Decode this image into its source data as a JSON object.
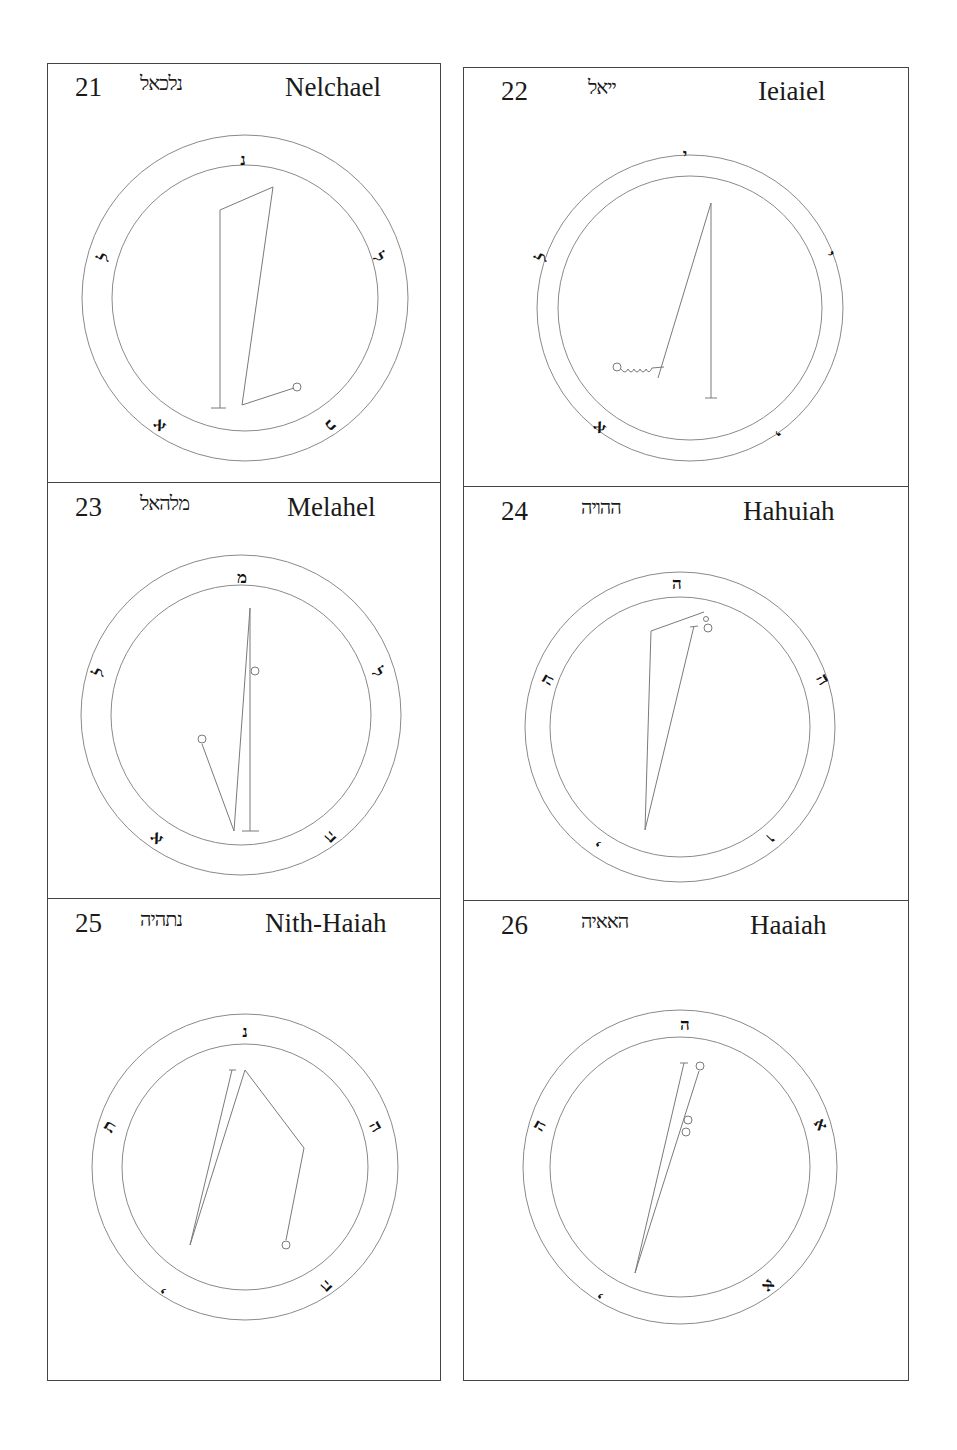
{
  "page": {
    "background": "#ffffff",
    "border_color": "#444444",
    "line_color": "#7a7a7a"
  },
  "panels": [
    {
      "number": "21",
      "hebrew": "נלכאל",
      "name": "Nelchael",
      "header": {
        "num_x": 75,
        "heb_x": 140,
        "name_x": 285,
        "top": 63
      },
      "circle": {
        "cx": 245,
        "cy": 298,
        "r_outer": 163,
        "r_inner": 133
      },
      "ring_letters": [
        {
          "char": "נ",
          "x": 243,
          "y": 160,
          "rot": 0
        },
        {
          "char": "ל",
          "x": 378,
          "y": 258,
          "rot": 60
        },
        {
          "char": "כ",
          "x": 330,
          "y": 425,
          "rot": 135
        },
        {
          "char": "א",
          "x": 160,
          "y": 425,
          "rot": -135
        },
        {
          "char": "ל",
          "x": 105,
          "y": 258,
          "rot": -60
        }
      ],
      "lines": [
        [
          [
            220,
            408
          ],
          [
            220,
            210
          ],
          [
            273,
            187
          ],
          [
            242,
            405
          ],
          [
            294,
            388
          ]
        ],
        [
          [
            211,
            408
          ],
          [
            226,
            408
          ]
        ]
      ],
      "dots": [
        {
          "x": 297,
          "y": 387,
          "r": 4
        }
      ]
    },
    {
      "number": "22",
      "hebrew": "ייאל",
      "name": "Ieiaiel",
      "header": {
        "num_x": 38,
        "heb_x": 130,
        "name_x": 295,
        "top": 67
      },
      "circle": {
        "cx": 690,
        "cy": 308,
        "r_outer": 153,
        "r_inner": 132
      },
      "ring_letters": [
        {
          "char": "י",
          "x": 685,
          "y": 155,
          "rot": 0
        },
        {
          "char": "י",
          "x": 829,
          "y": 255,
          "rot": 60
        },
        {
          "char": "י",
          "x": 776,
          "y": 432,
          "rot": 135
        },
        {
          "char": "א",
          "x": 600,
          "y": 427,
          "rot": -135
        },
        {
          "char": "ל",
          "x": 543,
          "y": 258,
          "rot": -60
        }
      ],
      "lines": [
        [
          [
            711,
            398
          ],
          [
            711,
            203
          ]
        ],
        [
          [
            705,
            398
          ],
          [
            717,
            398
          ]
        ],
        [
          [
            711,
            203
          ],
          [
            658,
            378
          ]
        ]
      ],
      "squiggle": {
        "x": 617,
        "y": 367
      },
      "dots": [
        {
          "x": 617,
          "y": 367,
          "r": 4
        }
      ]
    },
    {
      "number": "23",
      "hebrew": "מלהאל",
      "name": "Melahel",
      "header": {
        "num_x": 75,
        "heb_x": 140,
        "name_x": 288,
        "top": 482
      },
      "circle": {
        "cx": 241,
        "cy": 715,
        "r_outer": 160,
        "r_inner": 130
      },
      "ring_letters": [
        {
          "char": "מ",
          "x": 242,
          "y": 578,
          "rot": 0
        },
        {
          "char": "ל",
          "x": 377,
          "y": 673,
          "rot": 60
        },
        {
          "char": "ה",
          "x": 330,
          "y": 837,
          "rot": 135
        },
        {
          "char": "א",
          "x": 157,
          "y": 838,
          "rot": -135
        },
        {
          "char": "ל",
          "x": 100,
          "y": 673,
          "rot": -60
        }
      ],
      "lines": [
        [
          [
            250,
            831
          ],
          [
            250,
            608
          ],
          [
            234,
            831
          ],
          [
            202,
            744
          ]
        ],
        [
          [
            242,
            831
          ],
          [
            259,
            831
          ]
        ]
      ],
      "dots": [
        {
          "x": 255,
          "y": 671,
          "r": 4
        },
        {
          "x": 202,
          "y": 739,
          "r": 4
        }
      ]
    },
    {
      "number": "24",
      "hebrew": "ההויה",
      "name": "Hahuiah",
      "header": {
        "num_x": 38,
        "heb_x": 118,
        "name_x": 280,
        "top": 486
      },
      "circle": {
        "cx": 680,
        "cy": 727,
        "r_outer": 155,
        "r_inner": 130
      },
      "ring_letters": [
        {
          "char": "ה",
          "x": 677,
          "y": 584,
          "rot": 0
        },
        {
          "char": "ה",
          "x": 822,
          "y": 680,
          "rot": 60
        },
        {
          "char": "ו",
          "x": 770,
          "y": 838,
          "rot": 135
        },
        {
          "char": "י",
          "x": 600,
          "y": 842,
          "rot": -135
        },
        {
          "char": "ה",
          "x": 548,
          "y": 680,
          "rot": -60
        }
      ],
      "lines": [
        [
          [
            645,
            830
          ],
          [
            651,
            631
          ],
          [
            704,
            612
          ]
        ],
        [
          [
            645,
            830
          ],
          [
            694,
            626
          ]
        ],
        [
          [
            690,
            627
          ],
          [
            698,
            626
          ]
        ]
      ],
      "dots": [
        {
          "x": 708,
          "y": 628,
          "r": 4
        },
        {
          "x": 706,
          "y": 619,
          "r": 2.5
        }
      ]
    },
    {
      "number": "25",
      "hebrew": "נתהיה",
      "name": "Nith-Haiah",
      "header": {
        "num_x": 38,
        "heb_x": 98,
        "name_x": 218,
        "top": 898
      },
      "circle": {
        "cx": 245,
        "cy": 1167,
        "r_outer": 153,
        "r_inner": 123
      },
      "ring_letters": [
        {
          "char": "נ",
          "x": 245,
          "y": 1032,
          "rot": 0
        },
        {
          "char": "ה",
          "x": 375,
          "y": 1127,
          "rot": 60
        },
        {
          "char": "ה",
          "x": 326,
          "y": 1286,
          "rot": 135
        },
        {
          "char": "י",
          "x": 165,
          "y": 1289,
          "rot": -135
        },
        {
          "char": "ת",
          "x": 110,
          "y": 1127,
          "rot": -60
        }
      ],
      "lines": [
        [
          [
            190,
            1245
          ],
          [
            232,
            1070
          ]
        ],
        [
          [
            229,
            1070
          ],
          [
            236,
            1070
          ]
        ],
        [
          [
            190,
            1245
          ],
          [
            245,
            1070
          ],
          [
            304,
            1148
          ],
          [
            286,
            1240
          ]
        ]
      ],
      "dots": [
        {
          "x": 286,
          "y": 1245,
          "r": 4
        }
      ]
    },
    {
      "number": "26",
      "hebrew": "האאיה",
      "name": "Haaiah",
      "header": {
        "num_x": 38,
        "heb_x": 118,
        "name_x": 287,
        "top": 900
      },
      "circle": {
        "cx": 680,
        "cy": 1167,
        "r_outer": 157,
        "r_inner": 130
      },
      "ring_letters": [
        {
          "char": "ה",
          "x": 685,
          "y": 1025,
          "rot": 0
        },
        {
          "char": "א",
          "x": 820,
          "y": 1125,
          "rot": 60
        },
        {
          "char": "א",
          "x": 768,
          "y": 1285,
          "rot": 135
        },
        {
          "char": "י",
          "x": 602,
          "y": 1294,
          "rot": -135
        },
        {
          "char": "ה",
          "x": 540,
          "y": 1126,
          "rot": -60
        }
      ],
      "lines": [
        [
          [
            635,
            1273
          ],
          [
            684,
            1063
          ]
        ],
        [
          [
            680,
            1063
          ],
          [
            688,
            1063
          ]
        ],
        [
          [
            635,
            1273
          ],
          [
            699,
            1071
          ]
        ]
      ],
      "dots": [
        {
          "x": 700,
          "y": 1066,
          "r": 4
        },
        {
          "x": 688,
          "y": 1120,
          "r": 4
        },
        {
          "x": 686,
          "y": 1132,
          "r": 4
        }
      ]
    }
  ]
}
